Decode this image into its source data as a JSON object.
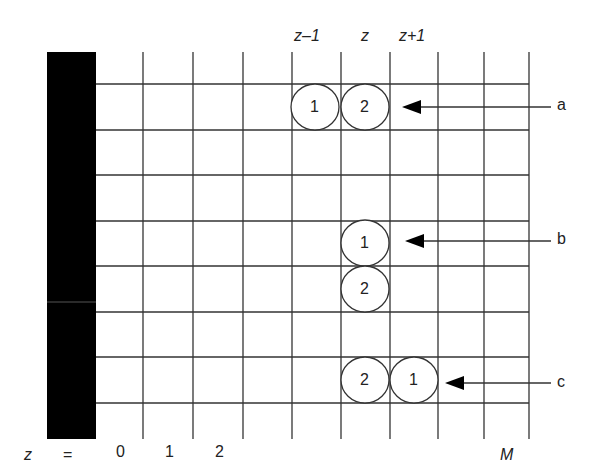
{
  "diagram": {
    "type": "lattice-grid",
    "colors": {
      "line": "#333333",
      "wall": "#000000",
      "circle_stroke": "#333333",
      "text": "#222222"
    },
    "top_labels": [
      {
        "text": "z–1",
        "col": 5
      },
      {
        "text": "z",
        "col": 6
      },
      {
        "text": "z+1",
        "col": 7
      }
    ],
    "bottom_labels": {
      "z_symbol": "z",
      "equals": "=",
      "ticks": [
        {
          "text": "0",
          "col": 0
        },
        {
          "text": "1",
          "col": 1
        },
        {
          "text": "2",
          "col": 2
        },
        {
          "text": "M",
          "col": 8,
          "italic": true
        }
      ]
    },
    "configurations": [
      {
        "label": "a",
        "description": "horizontal pair",
        "circles": [
          {
            "text": "1",
            "col": 5,
            "row": 0
          },
          {
            "text": "2",
            "col": 6,
            "row": 0
          }
        ]
      },
      {
        "label": "b",
        "description": "vertical pair",
        "circles": [
          {
            "text": "1",
            "col": 6,
            "row": 3
          },
          {
            "text": "2",
            "col": 6,
            "row": 4
          }
        ]
      },
      {
        "label": "c",
        "description": "horizontal pair reversed",
        "circles": [
          {
            "text": "2",
            "col": 6,
            "row": 6
          },
          {
            "text": "1",
            "col": 7,
            "row": 6
          }
        ]
      }
    ]
  }
}
